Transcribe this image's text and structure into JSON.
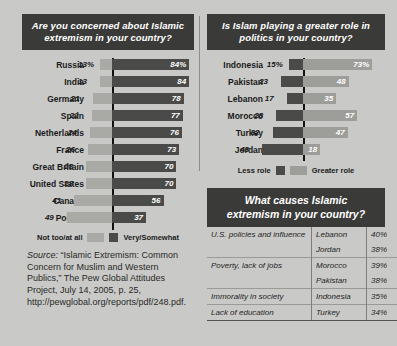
{
  "chart_data": [
    {
      "type": "bar",
      "subtype": "diverging-horizontal",
      "title": "Are you concerned about Islamic extremism in your country?",
      "categories": [
        "Russia",
        "India",
        "Germany",
        "Spain",
        "Netherlands",
        "France",
        "Great Britain",
        "United States",
        "Canada",
        "Poland"
      ],
      "series": [
        {
          "name": "Not too/at all",
          "values": [
            13,
            13,
            21,
            22,
            24,
            26,
            28,
            28,
            41,
            49
          ],
          "color": "#a9a9a6"
        },
        {
          "name": "Very/Somewhat",
          "values": [
            84,
            84,
            78,
            77,
            76,
            73,
            70,
            70,
            56,
            37
          ],
          "color": "#4a4a48"
        }
      ],
      "value_labels_left": [
        "13%",
        "13",
        "21",
        "22",
        "24",
        "26",
        "28",
        "28",
        "41",
        "49"
      ],
      "value_labels_right": [
        "84%",
        "84",
        "78",
        "77",
        "76",
        "73",
        "70",
        "70",
        "56",
        "37"
      ],
      "xlabel": "",
      "ylabel": "",
      "grid": false,
      "legend_position": "bottom"
    },
    {
      "type": "bar",
      "subtype": "diverging-horizontal",
      "title": "Is Islam playing a greater role in politics in your country?",
      "categories": [
        "Indonesia",
        "Pakistan",
        "Lebanon",
        "Morocco",
        "Turkey",
        "Jordan"
      ],
      "series": [
        {
          "name": "Less role",
          "values": [
            15,
            23,
            17,
            28,
            32,
            43
          ],
          "color": "#4a4a48"
        },
        {
          "name": "Greater role",
          "values": [
            73,
            48,
            35,
            57,
            47,
            18
          ],
          "color": "#9d9d9a"
        }
      ],
      "value_labels_left": [
        "15%",
        "23",
        "17",
        "28",
        "32",
        "43"
      ],
      "value_labels_right": [
        "73%",
        "48",
        "35",
        "57",
        "47",
        "18"
      ],
      "xlabel": "",
      "ylabel": "",
      "grid": false,
      "legend_position": "bottom"
    },
    {
      "type": "table",
      "title": "What causes Islamic extremism in your country?",
      "columns": [
        "cause",
        "country",
        "percent"
      ],
      "rows": [
        {
          "cause": "U.S. policies and influence",
          "country": "Lebanon",
          "percent": "40%"
        },
        {
          "cause": "",
          "country": "Jordan",
          "percent": "38%"
        },
        {
          "cause": "Poverty, lack of jobs",
          "country": "Morocco",
          "percent": "39%"
        },
        {
          "cause": "",
          "country": "Pakistan",
          "percent": "38%"
        },
        {
          "cause": "Immorality in society",
          "country": "Indonesia",
          "percent": "35%"
        },
        {
          "cause": "Lack of education",
          "country": "Turkey",
          "percent": "34%"
        }
      ]
    }
  ],
  "left_chart": {
    "banner_line1": "Are you concerned about Islamic",
    "banner_line2": "extremism in your country?",
    "rows": [
      {
        "label": "Russia",
        "left": "13%",
        "right": "84%"
      },
      {
        "label": "India",
        "left": "13",
        "right": "84"
      },
      {
        "label": "Germany",
        "left": "21",
        "right": "78"
      },
      {
        "label": "Spain",
        "left": "22",
        "right": "77"
      },
      {
        "label": "Netherlands",
        "left": "24",
        "right": "76"
      },
      {
        "label": "France",
        "left": "26",
        "right": "73"
      },
      {
        "label": "Great Britain",
        "left": "28",
        "right": "70"
      },
      {
        "label": "United States",
        "left": "28",
        "right": "70"
      },
      {
        "label": "Canada",
        "left": "41",
        "right": "56"
      },
      {
        "label": "Poland",
        "left": "49",
        "right": "37"
      }
    ],
    "legend_left": "Not too/at all",
    "legend_right": "Very/Somewhat"
  },
  "right_chart": {
    "banner_line1": "Is Islam playing a greater role in",
    "banner_line2": "politics in your country?",
    "rows": [
      {
        "label": "Indonesia",
        "left": "15%",
        "right": "73%"
      },
      {
        "label": "Pakistan",
        "left": "23",
        "right": "48"
      },
      {
        "label": "Lebanon",
        "left": "17",
        "right": "35"
      },
      {
        "label": "Morocco",
        "left": "28",
        "right": "57"
      },
      {
        "label": "Turkey",
        "left": "32",
        "right": "47"
      },
      {
        "label": "Jordan",
        "left": "43",
        "right": "18"
      }
    ],
    "legend_left": "Less role",
    "legend_right": "Greater role"
  },
  "causes_table": {
    "banner_line1": "What causes Islamic",
    "banner_line2": "extremism in your country?",
    "rows": [
      {
        "cause": "U.S. policies and influence",
        "country": "Lebanon",
        "percent": "40%"
      },
      {
        "cause": "",
        "country": "Jordan",
        "percent": "38%"
      },
      {
        "cause": "Poverty, lack of jobs",
        "country": "Morocco",
        "percent": "39%"
      },
      {
        "cause": "",
        "country": "Pakistan",
        "percent": "38%"
      },
      {
        "cause": "Immorality in society",
        "country": "Indonesia",
        "percent": "35%"
      },
      {
        "cause": "Lack of education",
        "country": "Turkey",
        "percent": "34%"
      }
    ]
  },
  "source": {
    "label": "Source:",
    "text": " “Islamic Extremism: Common Concern for Muslim and Western Publics,” The Pew Global Attitudes Project, July 14, 2005, p. 25, http://pewglobal.org/reports/pdf/248.pdf."
  },
  "colors": {
    "background": "#c9c9c7",
    "banner": "#3a3a38",
    "bar_light": "#a9a9a6",
    "bar_dark": "#4a4a48",
    "bar_mid": "#9d9d9a",
    "axis": "#111111"
  }
}
